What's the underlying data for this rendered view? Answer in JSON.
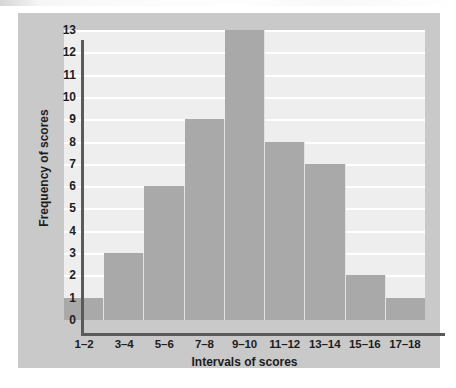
{
  "figure": {
    "background_color": "#c9c9c9",
    "plot_background_color": "#eeeeee",
    "bar_color": "#a9a9a9",
    "gridline_color": "#ffffff",
    "axis_color": "#5a5a5a",
    "text_color": "#1d1d1d"
  },
  "chart_data": {
    "type": "bar",
    "title": "",
    "xlabel": "Intervals of scores",
    "ylabel": "Frequency of scores",
    "categories": [
      "1–2",
      "3–4",
      "5–6",
      "7–8",
      "9–10",
      "11–12",
      "13–14",
      "15–16",
      "17–18"
    ],
    "values": [
      1,
      3,
      6,
      9,
      13,
      8,
      7,
      2,
      1
    ],
    "ylim": [
      0,
      13
    ],
    "ytick_labels": [
      "13",
      "12",
      "11",
      "10",
      "9",
      "8",
      "7",
      "6",
      "5",
      "4",
      "3",
      "2",
      "1",
      "0"
    ],
    "ytick_values": [
      13,
      12,
      11,
      10,
      9,
      8,
      7,
      6,
      5,
      4,
      3,
      2,
      1,
      0
    ],
    "grid": true,
    "grid_axis": "y",
    "legend": false,
    "legend_position": "none",
    "bar_style": "histogram-contiguous"
  }
}
